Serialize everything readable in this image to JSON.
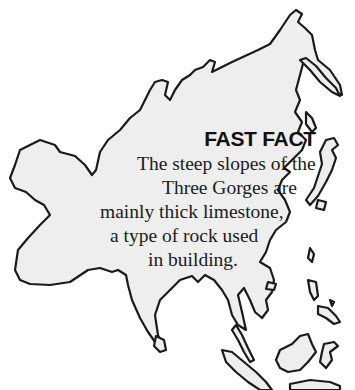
{
  "fast_fact": {
    "title": "FAST FACT",
    "lines": [
      "The steep slopes of the",
      "Three Gorges are",
      "mainly thick limestone,",
      "a type of rock used",
      "in building."
    ]
  },
  "map": {
    "subject": "Asia outline map",
    "fill_color": "#eeeeee",
    "stroke_color": "#1a1a1a"
  }
}
